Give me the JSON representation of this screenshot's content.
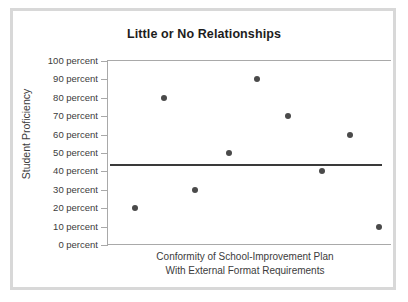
{
  "chart_data": {
    "type": "scatter",
    "title": "Little or No Relationships",
    "xlabel_line1": "Conformity of School-Improvement Plan",
    "xlabel_line2": "With External Format Requirements",
    "ylabel": "Student Proficiency",
    "ylim": [
      0,
      100
    ],
    "ytick_values": [
      100,
      90,
      80,
      70,
      60,
      50,
      40,
      30,
      20,
      10,
      0
    ],
    "ytick_labels": [
      "100 percent",
      "90 percent",
      "80 percent",
      "70 percent",
      "60 percent",
      "50 percent",
      "40 percent",
      "30 percent",
      "20 percent",
      "10 percent",
      "0 percent"
    ],
    "xtick_labels": [],
    "grid": false,
    "legend": false,
    "point_color": "#4a4a4a",
    "line_color": "#3a3a3a",
    "axis_color": "#a9a9a9",
    "points": [
      {
        "x": 10,
        "y": 20
      },
      {
        "x": 20,
        "y": 80
      },
      {
        "x": 31,
        "y": 30
      },
      {
        "x": 43,
        "y": 50
      },
      {
        "x": 53,
        "y": 90
      },
      {
        "x": 64,
        "y": 70
      },
      {
        "x": 76,
        "y": 40
      },
      {
        "x": 86,
        "y": 60
      },
      {
        "x": 96,
        "y": 10
      }
    ],
    "trend_line": {
      "type": "horizontal",
      "y": 44,
      "x_start": 1,
      "x_end": 97,
      "description": "flat regression line indicating no relationship"
    }
  }
}
